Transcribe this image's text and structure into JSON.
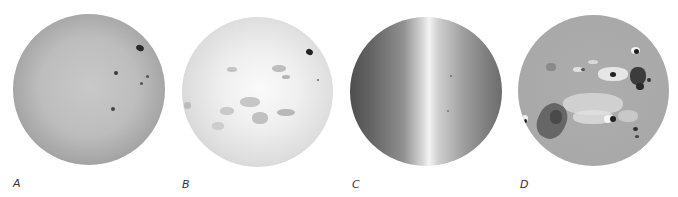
{
  "figure": {
    "panels": [
      {
        "id": "A",
        "label": "A",
        "description": "White-light full solar disk with limb darkening and sunspots"
      },
      {
        "id": "B",
        "label": "B",
        "description": "Chromospheric full-disk image with bright plage regions"
      },
      {
        "id": "C",
        "label": "C",
        "description": "Dopplergram full-disk image showing rotation gradient"
      },
      {
        "id": "D",
        "label": "D",
        "description": "Magnetogram full-disk image with black and white polarity regions"
      }
    ]
  }
}
